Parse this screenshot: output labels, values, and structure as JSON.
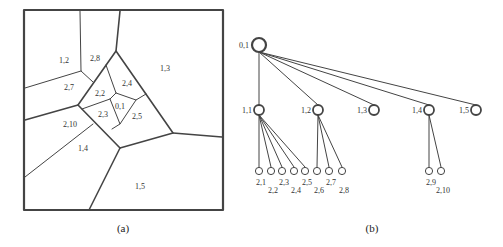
{
  "panel_a": {
    "caption": "(a)",
    "regions": [
      {
        "label": "1,2",
        "x": 64,
        "y": 63
      },
      {
        "label": "2,8",
        "x": 95,
        "y": 61
      },
      {
        "label": "1,3",
        "x": 165,
        "y": 71
      },
      {
        "label": "2,7",
        "x": 69,
        "y": 90
      },
      {
        "label": "2,4",
        "x": 127,
        "y": 86
      },
      {
        "label": "2,2",
        "x": 100,
        "y": 96
      },
      {
        "label": "0,1",
        "x": 120,
        "y": 109
      },
      {
        "label": "2,3",
        "x": 103,
        "y": 117
      },
      {
        "label": "2,5",
        "x": 137,
        "y": 119
      },
      {
        "label": "2,10",
        "x": 70,
        "y": 127
      },
      {
        "label": "1,4",
        "x": 83,
        "y": 151
      },
      {
        "label": "1,5",
        "x": 140,
        "y": 189
      }
    ]
  },
  "panel_b": {
    "caption": "(b)",
    "root": {
      "label": "0,1",
      "x": 259,
      "y": 45
    },
    "level1": [
      {
        "label": "1,1",
        "x": 259,
        "y": 110
      },
      {
        "label": "1,2",
        "x": 318,
        "y": 110
      },
      {
        "label": "1,3",
        "x": 374,
        "y": 110
      },
      {
        "label": "1,4",
        "x": 429,
        "y": 110
      },
      {
        "label": "1,5",
        "x": 476,
        "y": 110
      }
    ],
    "leaves": [
      {
        "label": "2,1",
        "parent": 0,
        "x": 259,
        "y": 171,
        "ly": 185
      },
      {
        "label": "2,2",
        "parent": 0,
        "x": 271,
        "y": 171,
        "ly": 193
      },
      {
        "label": "2,3",
        "parent": 0,
        "x": 282,
        "y": 171,
        "ly": 185
      },
      {
        "label": "2,4",
        "parent": 0,
        "x": 294,
        "y": 171,
        "ly": 193
      },
      {
        "label": "2,5",
        "parent": 0,
        "x": 305,
        "y": 171,
        "ly": 185
      },
      {
        "label": "2,6",
        "parent": 1,
        "x": 317,
        "y": 171,
        "ly": 193
      },
      {
        "label": "2,7",
        "parent": 1,
        "x": 329,
        "y": 171,
        "ly": 185
      },
      {
        "label": "2,8",
        "parent": 1,
        "x": 342,
        "y": 171,
        "ly": 193
      },
      {
        "label": "2,9",
        "parent": 3,
        "x": 429,
        "y": 171,
        "ly": 185
      },
      {
        "label": "2,10",
        "parent": 3,
        "x": 441,
        "y": 171,
        "ly": 193
      }
    ]
  }
}
